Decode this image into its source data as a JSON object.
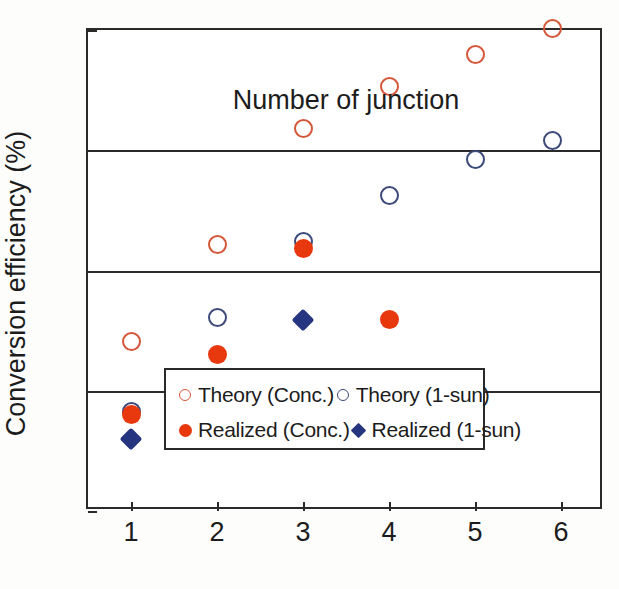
{
  "chart_data": {
    "type": "scatter",
    "title": "",
    "xlabel": "Number of junction",
    "ylabel": "Conversion efficiency (%)",
    "xlim": [
      0.5,
      6.5
    ],
    "ylim": [
      20,
      60
    ],
    "x_ticks": [
      1,
      2,
      3,
      4,
      5,
      6
    ],
    "y_ticks": [
      20,
      30,
      40,
      50,
      60
    ],
    "grid": "horizontal gridlines at 30, 40, 50",
    "legend_position": "inside lower right",
    "series": [
      {
        "name": "Theory (Conc.)",
        "marker": "open-circle",
        "color": "#D4573A",
        "points": [
          {
            "x": 1,
            "y": 34.1
          },
          {
            "x": 2,
            "y": 42.2
          },
          {
            "x": 3,
            "y": 51.8
          },
          {
            "x": 4,
            "y": 55.3
          },
          {
            "x": 5,
            "y": 58.0
          },
          {
            "x": 5.9,
            "y": 60.1
          }
        ]
      },
      {
        "name": "Theory (1-sun)",
        "marker": "open-circle",
        "color": "#3C4A7A",
        "points": [
          {
            "x": 1,
            "y": 28.3
          },
          {
            "x": 2,
            "y": 36.1
          },
          {
            "x": 3,
            "y": 42.4
          },
          {
            "x": 4,
            "y": 46.2
          },
          {
            "x": 5,
            "y": 49.2
          },
          {
            "x": 5.9,
            "y": 50.8
          }
        ]
      },
      {
        "name": "Realized (Conc.)",
        "marker": "filled-circle",
        "color": "#E8380D",
        "points": [
          {
            "x": 1,
            "y": 28.0
          },
          {
            "x": 2,
            "y": 33.0
          },
          {
            "x": 3,
            "y": 41.8
          },
          {
            "x": 4,
            "y": 35.9
          }
        ]
      },
      {
        "name": "Realized (1-sun)",
        "marker": "filled-diamond",
        "color": "#26357F",
        "points": [
          {
            "x": 1,
            "y": 26.0
          },
          {
            "x": 2,
            "y": 31.0
          },
          {
            "x": 3,
            "y": 35.9
          }
        ]
      }
    ]
  },
  "axes": {
    "y_tick_labels": [
      "60",
      "50",
      "40",
      "30",
      "20"
    ],
    "x_tick_labels": [
      "1",
      "2",
      "3",
      "4",
      "5",
      "6"
    ],
    "y_title": "Conversion efficiency (%)",
    "x_title": "Number of junction"
  },
  "legend": {
    "entries": [
      {
        "label": "Theory (Conc.)",
        "marker": "open",
        "color": "#D4573A"
      },
      {
        "label": "Theory (1-sun)",
        "marker": "open",
        "color": "#3C4A7A"
      },
      {
        "label": "Realized (Conc.)",
        "marker": "filled-circle",
        "color": "#E8380D"
      },
      {
        "label": "Realized (1-sun)",
        "marker": "diamond",
        "color": "#26357F"
      }
    ]
  },
  "colors": {
    "theory_conc": "#D4573A",
    "theory_1sun": "#3C4A7A",
    "realized_conc": "#E8380D",
    "realized_1sun": "#26357F",
    "axis": "#2a2a2a"
  }
}
